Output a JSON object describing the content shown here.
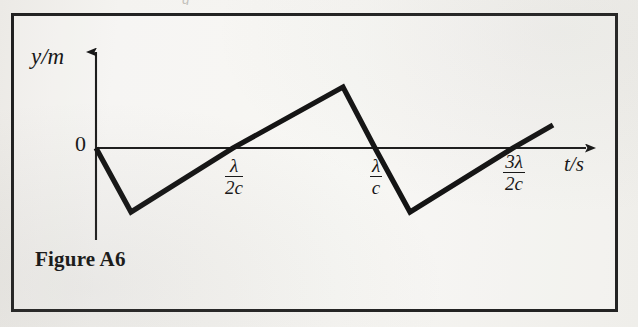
{
  "figure": {
    "caption": "Figure A6",
    "bleed_text_above": "g",
    "frame_color": "#232323",
    "ink_color": "#171717",
    "paper_color": "#f2f1ee"
  },
  "axes": {
    "y_label": "y/m",
    "x_label": "t/s",
    "origin_label": "0"
  },
  "ticks": [
    {
      "name": "half-lambda-over-c",
      "numerator": "λ",
      "denominator": "2c"
    },
    {
      "name": "lambda-over-c",
      "numerator": "λ",
      "denominator": "c"
    },
    {
      "name": "three-half-lambda-over-c",
      "numerator": "3λ",
      "denominator": "2c"
    }
  ],
  "chart_data": {
    "type": "line",
    "title": "Figure A6",
    "xlabel": "t/s",
    "ylabel": "y/m",
    "grid": false,
    "legend": "none",
    "x_tick_values": [
      "λ/2c",
      "λ/c",
      "3λ/2c"
    ],
    "x_tick_px": [
      233,
      375,
      513
    ],
    "y_tick_values": [
      "0"
    ],
    "x": [
      0,
      0.25,
      1.0,
      1.5,
      1.75,
      2.0,
      2.75,
      3.0
    ],
    "y": [
      0,
      -1,
      0,
      1,
      0,
      -1,
      0,
      0.38
    ],
    "series": [
      {
        "name": "displacement",
        "points_px": [
          [
            96,
            148
          ],
          [
            131,
            212
          ],
          [
            233,
            148
          ],
          [
            343,
            87
          ],
          [
            375,
            148
          ],
          [
            410,
            212
          ],
          [
            513,
            148
          ],
          [
            553,
            125
          ]
        ]
      }
    ],
    "axis_px": {
      "x_axis_y": 148,
      "y_axis_x": 96,
      "x_axis_start": 96,
      "x_axis_end": 592,
      "y_axis_top": 45,
      "y_axis_bottom": 240
    }
  }
}
